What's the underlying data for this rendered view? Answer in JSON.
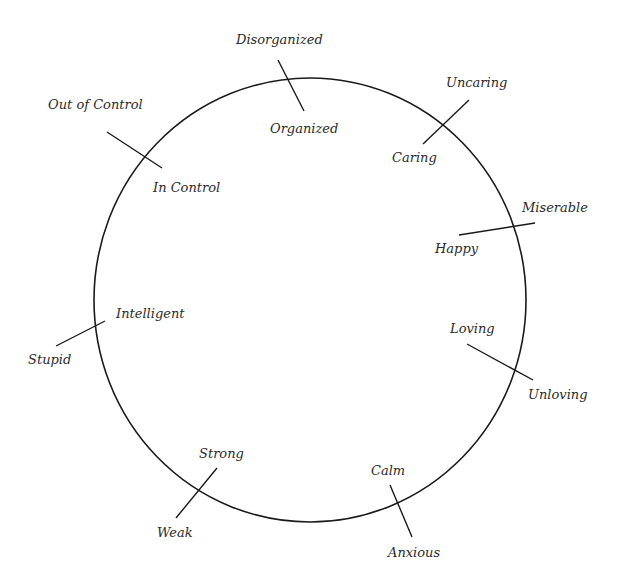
{
  "diagram": {
    "circle": {
      "cx": 310,
      "cy": 300,
      "rx": 216,
      "ry": 222,
      "stroke": "#1a1a1a"
    },
    "axes": [
      {
        "outer": "Disorganized",
        "inner": "Organized"
      },
      {
        "outer": "Uncaring",
        "inner": "Caring"
      },
      {
        "outer": "Miserable",
        "inner": "Happy"
      },
      {
        "outer": "Unloving",
        "inner": "Loving"
      },
      {
        "outer": "Anxious",
        "inner": "Calm"
      },
      {
        "outer": "Weak",
        "inner": "Strong"
      },
      {
        "outer": "Stupid",
        "inner": "Intelligent"
      },
      {
        "outer": "Out of Control",
        "inner": "In Control"
      }
    ]
  }
}
